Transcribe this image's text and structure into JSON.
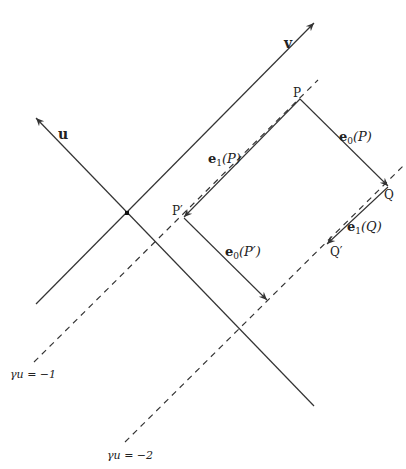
{
  "diagram": {
    "axes": {
      "v_label": "v",
      "u_label": "u"
    },
    "points": {
      "P": "P",
      "Q": "Q",
      "P_prime": "P′",
      "Q_prime": "Q′"
    },
    "vectors": {
      "e0_P": {
        "base": "e",
        "sub": "0",
        "arg": "(P)"
      },
      "e1_P": {
        "base": "e",
        "sub": "1",
        "arg": "(P)"
      },
      "e0_Pp": {
        "base": "e",
        "sub": "0",
        "arg": "(P′)"
      },
      "e1_Q": {
        "base": "e",
        "sub": "1",
        "arg": "(Q)"
      }
    },
    "level_lines": {
      "minus1": "γu = −1",
      "minus2": "γu = −2"
    },
    "colors": {
      "line": "#333333",
      "background": "#ffffff"
    }
  }
}
